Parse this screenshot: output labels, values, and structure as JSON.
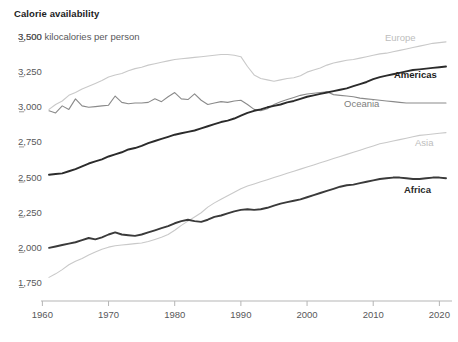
{
  "header": {
    "title": "Calorie availability",
    "unit_label": "3,500 kilocalories per person"
  },
  "chart_data": {
    "type": "line",
    "title": "Calorie availability",
    "subtitle": "kilocalories per person",
    "xlabel": "",
    "ylabel": "kilocalories per person",
    "xlim": [
      1961,
      2021
    ],
    "ylim": [
      1700,
      3520
    ],
    "grid": false,
    "legend_position": "inline-end-of-line",
    "y_ticks": [
      1750,
      2000,
      2250,
      2500,
      2750,
      3000,
      3250,
      3500
    ],
    "y_tick_labels": [
      "1,750",
      "2,000",
      "2,250",
      "2,500",
      "2,750",
      "3,000",
      "3,250",
      "3,500"
    ],
    "x_ticks": [
      1960,
      1970,
      1980,
      1990,
      2000,
      2010,
      2020
    ],
    "x_tick_labels": [
      "1960",
      "1970",
      "1980",
      "1990",
      "2000",
      "2010",
      "2020"
    ],
    "x": [
      1961,
      1962,
      1963,
      1964,
      1965,
      1966,
      1967,
      1968,
      1969,
      1970,
      1971,
      1972,
      1973,
      1974,
      1975,
      1976,
      1977,
      1978,
      1979,
      1980,
      1981,
      1982,
      1983,
      1984,
      1985,
      1986,
      1987,
      1988,
      1989,
      1990,
      1991,
      1992,
      1993,
      1994,
      1995,
      1996,
      1997,
      1998,
      1999,
      2000,
      2001,
      2002,
      2003,
      2004,
      2005,
      2006,
      2007,
      2008,
      2009,
      2010,
      2011,
      2012,
      2013,
      2014,
      2015,
      2016,
      2017,
      2018,
      2019,
      2020,
      2021
    ],
    "series": [
      {
        "name": "Europe",
        "color": "#c9c9c9",
        "label_color": "#bdbdbd",
        "label_bold": false,
        "values": [
          2985,
          3020,
          3045,
          3085,
          3105,
          3130,
          3150,
          3170,
          3190,
          3215,
          3230,
          3240,
          3260,
          3275,
          3285,
          3300,
          3310,
          3320,
          3330,
          3340,
          3345,
          3350,
          3355,
          3360,
          3365,
          3370,
          3375,
          3375,
          3370,
          3360,
          3290,
          3230,
          3205,
          3195,
          3185,
          3195,
          3205,
          3210,
          3225,
          3250,
          3265,
          3280,
          3300,
          3315,
          3325,
          3335,
          3340,
          3350,
          3360,
          3370,
          3380,
          3385,
          3395,
          3405,
          3415,
          3425,
          3435,
          3445,
          3455,
          3460,
          3465
        ]
      },
      {
        "name": "Oceania",
        "color": "#8a8a8a",
        "label_color": "#7d7d7d",
        "label_bold": false,
        "values": [
          2975,
          2960,
          3010,
          2985,
          3060,
          3010,
          3000,
          3005,
          3010,
          3015,
          3080,
          3035,
          3025,
          3030,
          3030,
          3035,
          3060,
          3040,
          3075,
          3105,
          3060,
          3055,
          3095,
          3050,
          3020,
          3030,
          3040,
          3035,
          3045,
          3050,
          3020,
          2985,
          2975,
          2990,
          3020,
          3040,
          3055,
          3070,
          3085,
          3095,
          3100,
          3105,
          3110,
          3090,
          3085,
          3080,
          3075,
          3065,
          3060,
          3055,
          3050,
          3045,
          3040,
          3035,
          3030,
          3030,
          3030,
          3030,
          3030,
          3030,
          3030
        ]
      },
      {
        "name": "Americas",
        "color": "#2b2b2b",
        "label_color": "#1c1c1c",
        "label_bold": true,
        "values": [
          2520,
          2525,
          2530,
          2545,
          2560,
          2580,
          2600,
          2615,
          2630,
          2650,
          2665,
          2680,
          2700,
          2710,
          2725,
          2745,
          2760,
          2775,
          2790,
          2805,
          2815,
          2825,
          2835,
          2850,
          2865,
          2880,
          2895,
          2905,
          2920,
          2940,
          2960,
          2975,
          2985,
          3000,
          3010,
          3020,
          3035,
          3045,
          3060,
          3075,
          3085,
          3095,
          3105,
          3115,
          3125,
          3135,
          3150,
          3165,
          3180,
          3200,
          3215,
          3225,
          3235,
          3245,
          3255,
          3265,
          3270,
          3275,
          3280,
          3285,
          3290
        ]
      },
      {
        "name": "Asia",
        "color": "#c9c9c9",
        "label_color": "#bdbdbd",
        "label_bold": false,
        "values": [
          1790,
          1815,
          1845,
          1880,
          1905,
          1925,
          1950,
          1970,
          1990,
          2005,
          2015,
          2020,
          2025,
          2030,
          2035,
          2045,
          2060,
          2075,
          2095,
          2125,
          2160,
          2190,
          2220,
          2250,
          2290,
          2320,
          2345,
          2370,
          2395,
          2420,
          2440,
          2455,
          2470,
          2485,
          2500,
          2515,
          2530,
          2545,
          2560,
          2575,
          2590,
          2605,
          2620,
          2635,
          2650,
          2665,
          2680,
          2695,
          2710,
          2725,
          2740,
          2750,
          2760,
          2770,
          2780,
          2790,
          2800,
          2805,
          2810,
          2815,
          2820
        ]
      },
      {
        "name": "Africa",
        "color": "#3a3a3a",
        "label_color": "#2a2a2a",
        "label_bold": true,
        "values": [
          2000,
          2010,
          2020,
          2030,
          2040,
          2055,
          2070,
          2060,
          2075,
          2095,
          2110,
          2095,
          2090,
          2085,
          2095,
          2110,
          2125,
          2140,
          2155,
          2175,
          2190,
          2200,
          2190,
          2185,
          2200,
          2220,
          2230,
          2245,
          2260,
          2270,
          2275,
          2270,
          2275,
          2285,
          2300,
          2315,
          2325,
          2335,
          2345,
          2360,
          2375,
          2390,
          2405,
          2420,
          2435,
          2445,
          2450,
          2460,
          2470,
          2480,
          2490,
          2495,
          2500,
          2500,
          2495,
          2490,
          2490,
          2495,
          2500,
          2500,
          2495
        ]
      }
    ],
    "annotations": [
      {
        "text": "Europe",
        "x": 2016,
        "y": 3500
      },
      {
        "text": "Americas",
        "x": 2014,
        "y": 3190
      },
      {
        "text": "Oceania",
        "x": 2002,
        "y": 2950
      },
      {
        "text": "Asia",
        "x": 2019,
        "y": 2660
      },
      {
        "text": "Africa",
        "x": 2016,
        "y": 2310
      }
    ]
  },
  "labels": {
    "europe": "Europe",
    "americas": "Americas",
    "oceania": "Oceania",
    "asia": "Asia",
    "africa": "Africa"
  }
}
